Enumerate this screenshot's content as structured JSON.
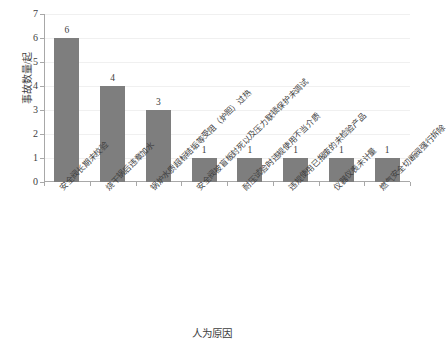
{
  "chart_data": {
    "type": "bar",
    "title": "",
    "xlabel": "人为原因",
    "ylabel": "事故数量/起",
    "ylim": [
      0,
      7
    ],
    "ytick_labels": [
      "0",
      "1",
      "2",
      "3",
      "4",
      "5",
      "6",
      "7"
    ],
    "grid": true,
    "legend": false,
    "bar_color": "#7e7e7e",
    "axis_color": "#a8a8a8",
    "grid_color": "#f0f0f0",
    "categories": [
      "安全阀长期未校验",
      "烧干锅后违章加水",
      "锅炉水质超标结垢等受阻（炉胆）过热",
      "安全阀被盲板封死以及压力联锁保护未调试",
      "耐压试验时违规使用不当介质",
      "违规使用已报废的未检验产品",
      "仪器仪表未计量",
      "燃气安全切断阀强行拆除"
    ],
    "values": [
      6,
      4,
      3,
      1,
      1,
      1,
      1,
      1
    ],
    "value_labels": [
      "6",
      "4",
      "3",
      "1",
      "1",
      "1",
      "1",
      "1"
    ]
  }
}
